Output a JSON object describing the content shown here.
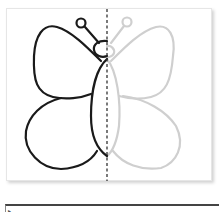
{
  "worksheet": {
    "task": "symmetry-drawing",
    "figure": "butterfly",
    "left_half": "drawn",
    "right_half": "faint-guide",
    "axis": "dashed-vertical"
  },
  "colors": {
    "outline_dark": "#1a1a1a",
    "outline_faint": "#cfcfcf",
    "axis": "#333333"
  },
  "answer_box": {
    "value": ""
  }
}
